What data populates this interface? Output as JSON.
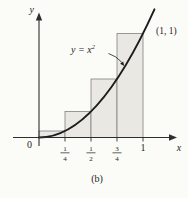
{
  "figure": {
    "caption": "(b)",
    "point_label": "(1, 1)",
    "curve_label_base": "y = x",
    "curve_label_exp": "2",
    "y_axis_label": "y",
    "x_axis_label": "x",
    "origin_label": "0",
    "ticks": {
      "t1": {
        "num": "1",
        "den": "4"
      },
      "t2": {
        "num": "1",
        "den": "2"
      },
      "t3": {
        "num": "3",
        "den": "4"
      },
      "t4": "1"
    }
  },
  "colors": {
    "background": "#fbfbf8",
    "rect_fill": "#e9e8e3",
    "rect_stroke": "#808080",
    "curve": "#1c1c1c",
    "axis": "#2e2e2e",
    "text": "#1f1f1f"
  },
  "chart_data": {
    "type": "area",
    "curve": {
      "equation": "y = x²",
      "label": "y = x²",
      "x_plot_range": [
        0,
        1.11
      ]
    },
    "riemann_rectangles": [
      {
        "x_start": 0,
        "x_end": 0.25,
        "height": 0.0625
      },
      {
        "x_start": 0.25,
        "x_end": 0.5,
        "height": 0.25
      },
      {
        "x_start": 0.5,
        "x_end": 0.75,
        "height": 0.5625
      },
      {
        "x_start": 0.75,
        "x_end": 1,
        "height": 1
      }
    ],
    "tick_values": [
      0.25,
      0.5,
      0.75,
      1
    ],
    "x_tick_labels": [
      "0",
      "1/4",
      "1/2",
      "3/4",
      "1"
    ],
    "xlabel": "x",
    "ylabel": "y",
    "annotated_point": {
      "x": 1,
      "y": 1,
      "label": "(1, 1)"
    },
    "xlim": [
      0,
      1.3
    ],
    "ylim": [
      0,
      1.25
    ],
    "grid": false,
    "caption": "(b)"
  }
}
